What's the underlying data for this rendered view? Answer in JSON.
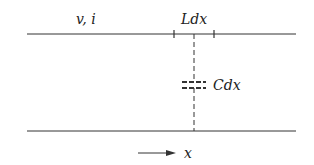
{
  "diagram": {
    "type": "transmission-line-segment",
    "labels": {
      "voltage_current": "v, i",
      "inductance": "Ldx",
      "capacitance": "Cdx",
      "axis": "x"
    },
    "colors": {
      "line": "#333333",
      "background": "#ffffff"
    },
    "elements": [
      {
        "name": "top-conductor",
        "kind": "line"
      },
      {
        "name": "bottom-conductor",
        "kind": "line"
      },
      {
        "name": "series-inductance-segment",
        "kind": "segment-marked-by-ticks"
      },
      {
        "name": "shunt-capacitor",
        "kind": "capacitor",
        "connection": "dashed"
      },
      {
        "name": "direction-arrow",
        "kind": "arrow",
        "direction": "right"
      }
    ]
  }
}
